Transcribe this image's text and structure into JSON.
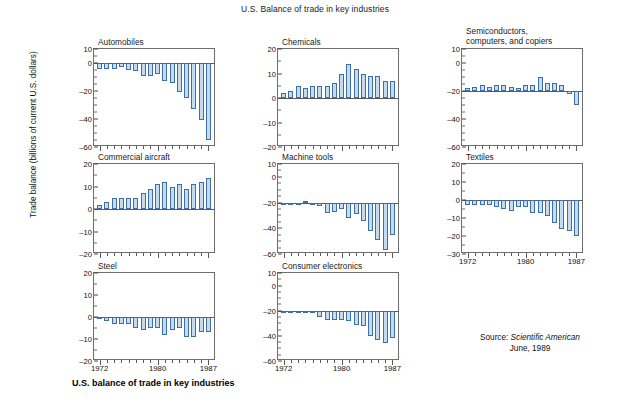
{
  "figure": {
    "title": "U.S. Balance of trade in key industries",
    "ylabel": "Trade balance (billions of current U.S. dollars)",
    "caption": "U.S. balance of trade in key industries",
    "source_prefix": "Source: ",
    "source_publication": "Scientific American",
    "source_date": "June, 1989"
  },
  "axis": {
    "x_labels": [
      "1972",
      "1980",
      "1987"
    ],
    "x_start": 1972,
    "x_end": 1987
  },
  "colors": {
    "bar_fill": "#c5dcf0",
    "bar_stroke": "#3f6fa8",
    "axis": "#5a5a5a",
    "text": "#111111"
  },
  "chart_data": [
    {
      "type": "bar",
      "title": "Automobiles",
      "xlabel": "",
      "ylabel": "Trade balance (billions of current U.S. dollars)",
      "ylim": [
        -60,
        10
      ],
      "yticks": [
        10,
        0,
        -20,
        -40,
        -60
      ],
      "yminor": [
        5,
        -5,
        -10,
        -15,
        -25,
        -30,
        -35,
        -45,
        -50,
        -55
      ],
      "baseline": 0,
      "grid": false,
      "categories": [
        "1972",
        "1973",
        "1974",
        "1975",
        "1976",
        "1977",
        "1978",
        "1979",
        "1980",
        "1981",
        "1982",
        "1983",
        "1984",
        "1985",
        "1986",
        "1987"
      ],
      "values": [
        -4,
        -4,
        -4,
        -3,
        -5,
        -6,
        -9,
        -9,
        -8,
        -13,
        -14,
        -21,
        -25,
        -33,
        -41,
        -55
      ]
    },
    {
      "type": "bar",
      "title": "Chemicals",
      "xlabel": "",
      "ylabel": "",
      "ylim": [
        -20,
        20
      ],
      "yticks": [
        20,
        10,
        0,
        -10,
        -20
      ],
      "yminor": [
        15,
        5,
        -5,
        -15
      ],
      "baseline": 0,
      "grid": false,
      "categories": [
        "1972",
        "1973",
        "1974",
        "1975",
        "1976",
        "1977",
        "1978",
        "1979",
        "1980",
        "1981",
        "1982",
        "1983",
        "1984",
        "1985",
        "1986",
        "1987"
      ],
      "values": [
        2,
        3,
        5,
        4,
        5,
        5,
        5,
        6,
        10,
        14,
        12,
        10,
        9,
        9,
        7,
        7
      ]
    },
    {
      "type": "bar",
      "title": "Semiconductors, computers, and copiers",
      "xlabel": "",
      "ylabel": "",
      "ylim": [
        -60,
        10
      ],
      "yticks": [
        10,
        0,
        -20,
        -40,
        -60
      ],
      "yminor": [
        5,
        -5,
        -10,
        -15,
        -25,
        -30,
        -35,
        -45,
        -50,
        -55
      ],
      "baseline": -20,
      "grid": false,
      "categories": [
        "1972",
        "1973",
        "1974",
        "1975",
        "1976",
        "1977",
        "1978",
        "1979",
        "1980",
        "1981",
        "1982",
        "1983",
        "1984",
        "1985",
        "1986",
        "1987"
      ],
      "values": [
        -18,
        -17,
        -16,
        -17,
        -16,
        -16,
        -17,
        -18,
        -16,
        -16,
        -10,
        -14,
        -14,
        -16,
        -22,
        -30
      ]
    },
    {
      "type": "bar",
      "title": "Commercial aircraft",
      "xlabel": "",
      "ylabel": "",
      "ylim": [
        -20,
        20
      ],
      "yticks": [
        20,
        10,
        0,
        -10,
        -20
      ],
      "yminor": [
        15,
        5,
        -5,
        -15
      ],
      "baseline": 0,
      "grid": false,
      "categories": [
        "1972",
        "1973",
        "1974",
        "1975",
        "1976",
        "1977",
        "1978",
        "1979",
        "1980",
        "1981",
        "1982",
        "1983",
        "1984",
        "1985",
        "1986",
        "1987"
      ],
      "values": [
        2,
        3,
        5,
        5,
        5,
        5,
        7,
        9,
        11,
        12,
        10,
        11,
        9,
        11,
        12,
        14
      ]
    },
    {
      "type": "bar",
      "title": "Machine tools",
      "xlabel": "",
      "ylabel": "",
      "ylim": [
        -60,
        10
      ],
      "yticks": [
        10,
        0,
        -20,
        -40,
        -60
      ],
      "yminor": [
        5,
        -5,
        -10,
        -15,
        -25,
        -30,
        -35,
        -45,
        -50,
        -55
      ],
      "baseline": -20,
      "grid": false,
      "categories": [
        "1972",
        "1973",
        "1974",
        "1975",
        "1976",
        "1977",
        "1978",
        "1979",
        "1980",
        "1981",
        "1982",
        "1983",
        "1984",
        "1985",
        "1986",
        "1987"
      ],
      "values": [
        -20,
        -20,
        -20,
        -19,
        -20,
        -23,
        -28,
        -27,
        -25,
        -32,
        -29,
        -34,
        -42,
        -49,
        -57,
        -45
      ]
    },
    {
      "type": "bar",
      "title": "Textiles",
      "xlabel": "",
      "ylabel": "",
      "ylim": [
        -30,
        20
      ],
      "yticks": [
        20,
        10,
        0,
        -10,
        -20,
        -30
      ],
      "yminor": [
        15,
        5,
        -5,
        -15,
        -25
      ],
      "baseline": 0,
      "grid": false,
      "categories": [
        "1972",
        "1973",
        "1974",
        "1975",
        "1976",
        "1977",
        "1978",
        "1979",
        "1980",
        "1981",
        "1982",
        "1983",
        "1984",
        "1985",
        "1986",
        "1987"
      ],
      "values": [
        -3,
        -3,
        -3,
        -3,
        -4,
        -5,
        -6,
        -4,
        -4,
        -7,
        -7,
        -9,
        -13,
        -16,
        -17,
        -20
      ]
    },
    {
      "type": "bar",
      "title": "Steel",
      "xlabel": "",
      "ylabel": "",
      "ylim": [
        -20,
        20
      ],
      "yticks": [
        20,
        10,
        0,
        -10,
        -20
      ],
      "yminor": [
        15,
        5,
        -5,
        -15
      ],
      "baseline": 0,
      "grid": false,
      "categories": [
        "1972",
        "1973",
        "1974",
        "1975",
        "1976",
        "1977",
        "1978",
        "1979",
        "1980",
        "1981",
        "1982",
        "1983",
        "1984",
        "1985",
        "1986",
        "1987"
      ],
      "values": [
        -1,
        -2,
        -3,
        -3,
        -3,
        -5,
        -6,
        -5,
        -5,
        -8,
        -6,
        -5,
        -9,
        -9,
        -7,
        -7
      ]
    },
    {
      "type": "bar",
      "title": "Consumer electronics",
      "xlabel": "",
      "ylabel": "",
      "ylim": [
        -60,
        10
      ],
      "yticks": [
        10,
        0,
        -20,
        -40,
        -60
      ],
      "yminor": [
        5,
        -5,
        -10,
        -15,
        -25,
        -30,
        -35,
        -45,
        -50,
        -55
      ],
      "baseline": -20,
      "grid": false,
      "categories": [
        "1972",
        "1973",
        "1974",
        "1975",
        "1976",
        "1977",
        "1978",
        "1979",
        "1980",
        "1981",
        "1982",
        "1983",
        "1984",
        "1985",
        "1986",
        "1987"
      ],
      "values": [
        -22,
        -22,
        -22,
        -22,
        -22,
        -25,
        -27,
        -27,
        -27,
        -28,
        -31,
        -32,
        -40,
        -43,
        -46,
        -42
      ]
    }
  ],
  "panel_layout": [
    {
      "index": 0,
      "left": 93,
      "top": 48,
      "width": 122,
      "height": 98,
      "title_lines": 1
    },
    {
      "index": 1,
      "left": 277,
      "top": 48,
      "width": 122,
      "height": 98,
      "title_lines": 1
    },
    {
      "index": 2,
      "left": 461,
      "top": 48,
      "width": 122,
      "height": 98,
      "title_lines": 2
    },
    {
      "index": 3,
      "left": 93,
      "top": 163,
      "width": 122,
      "height": 90,
      "title_lines": 1
    },
    {
      "index": 4,
      "left": 277,
      "top": 163,
      "width": 122,
      "height": 90,
      "title_lines": 1
    },
    {
      "index": 5,
      "left": 461,
      "top": 163,
      "width": 122,
      "height": 90,
      "title_lines": 1
    },
    {
      "index": 6,
      "left": 93,
      "top": 272,
      "width": 122,
      "height": 88,
      "title_lines": 1
    },
    {
      "index": 7,
      "left": 277,
      "top": 272,
      "width": 122,
      "height": 88,
      "title_lines": 1
    }
  ]
}
